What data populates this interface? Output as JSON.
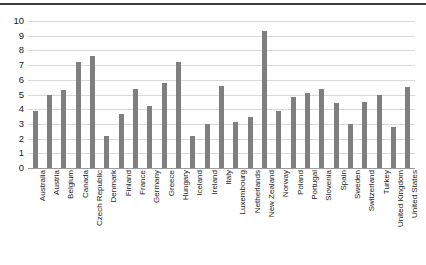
{
  "chart_data": {
    "type": "bar",
    "title": "",
    "subtitle": "",
    "xlabel": "",
    "ylabel": "",
    "ylim": [
      0,
      10
    ],
    "yticks": [
      0,
      1,
      2,
      3,
      4,
      5,
      6,
      7,
      8,
      9,
      10
    ],
    "grid": true,
    "legend": false,
    "bar_color": "#7f7f7f",
    "gridline_color": "#d9d9d9",
    "axis_color": "#9a9a9a",
    "categories": [
      "Australia",
      "Austria",
      "Belgium",
      "Canada",
      "Czech Republic",
      "Denmark",
      "Finland",
      "France",
      "Germany",
      "Greece",
      "Hungary",
      "Iceland",
      "Ireland",
      "Italy",
      "Luxembourg",
      "Netherlands",
      "New Zealand",
      "Norway",
      "Poland",
      "Portugal",
      "Slovenia",
      "Spain",
      "Sweden",
      "Switzerland",
      "Turkey",
      "United Kingdom",
      "United States"
    ],
    "values": [
      3.9,
      5.0,
      5.3,
      7.2,
      7.6,
      2.2,
      3.7,
      5.4,
      4.2,
      5.8,
      7.2,
      2.2,
      3.0,
      5.6,
      3.1,
      3.5,
      9.3,
      3.9,
      4.8,
      5.1,
      5.4,
      4.4,
      3.0,
      4.5,
      5.0,
      2.8,
      5.5
    ]
  }
}
